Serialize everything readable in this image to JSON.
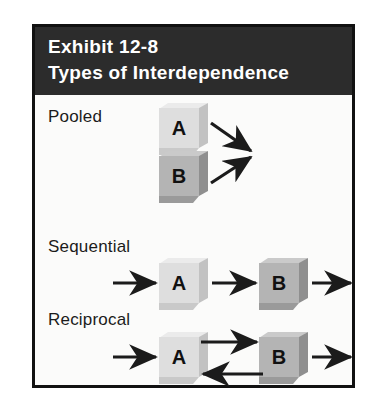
{
  "exhibit": {
    "header": {
      "line1": "Exhibit 12-8",
      "line2": "Types of Interdependence",
      "background_color": "#2c2c2c",
      "text_color": "#ffffff"
    },
    "frame": {
      "border_color": "#111111",
      "background_color": "#fbfbfa"
    },
    "rows": [
      {
        "label": "Pooled",
        "boxes": [
          {
            "letter": "A",
            "shade": "light",
            "fill_color": "#dedede"
          },
          {
            "letter": "B",
            "shade": "dark",
            "fill_color": "#b4b4b4"
          }
        ],
        "arrows": [
          {
            "from": "A",
            "to": "convergence-point",
            "direction": "down-right"
          },
          {
            "from": "B",
            "to": "convergence-point",
            "direction": "up-right"
          }
        ]
      },
      {
        "label": "Sequential",
        "boxes": [
          {
            "letter": "A",
            "shade": "light",
            "fill_color": "#dedede"
          },
          {
            "letter": "B",
            "shade": "dark",
            "fill_color": "#b4b4b4"
          }
        ],
        "arrows": [
          {
            "from": "input",
            "to": "A",
            "direction": "right"
          },
          {
            "from": "A",
            "to": "B",
            "direction": "right"
          },
          {
            "from": "B",
            "to": "output",
            "direction": "right"
          }
        ]
      },
      {
        "label": "Reciprocal",
        "boxes": [
          {
            "letter": "A",
            "shade": "light",
            "fill_color": "#dedede"
          },
          {
            "letter": "B",
            "shade": "dark",
            "fill_color": "#b4b4b4"
          }
        ],
        "arrows": [
          {
            "from": "input",
            "to": "A",
            "direction": "right"
          },
          {
            "from": "A",
            "to": "B",
            "direction": "right"
          },
          {
            "from": "B",
            "to": "A",
            "direction": "left"
          },
          {
            "from": "B",
            "to": "output",
            "direction": "right"
          }
        ]
      }
    ]
  }
}
